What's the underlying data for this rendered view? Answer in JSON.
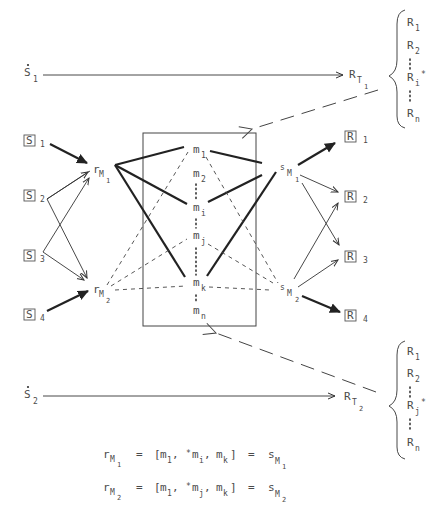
{
  "diagram": {
    "stimuli_boxed": [
      {
        "id": "S1",
        "glyph": "S",
        "index": "1"
      },
      {
        "id": "S2",
        "glyph": "S",
        "index": "2"
      },
      {
        "id": "S3",
        "glyph": "S",
        "index": "3"
      },
      {
        "id": "S4",
        "glyph": "S",
        "index": "4"
      }
    ],
    "responses_boxed": [
      {
        "id": "R1",
        "glyph": "R",
        "index": "1"
      },
      {
        "id": "R2",
        "glyph": "R",
        "index": "2"
      },
      {
        "id": "R3",
        "glyph": "R",
        "index": "3"
      },
      {
        "id": "R4",
        "glyph": "R",
        "index": "4"
      }
    ],
    "dotted_stimuli": [
      {
        "id": "S1dot",
        "glyph": "S",
        "index": "1"
      },
      {
        "id": "S2dot",
        "glyph": "S",
        "index": "2"
      }
    ],
    "mediators_in": [
      {
        "base": "r",
        "sub": "M",
        "subsub": "1"
      },
      {
        "base": "r",
        "sub": "M",
        "subsub": "2"
      }
    ],
    "mediators_out": [
      {
        "base": "s",
        "sub": "M",
        "subsub": "1"
      },
      {
        "base": "s",
        "sub": "M",
        "subsub": "2"
      }
    ],
    "meaning_components": [
      {
        "base": "m",
        "sub": "1"
      },
      {
        "base": "m",
        "sub": "2"
      },
      {
        "base": "m",
        "sub": "i"
      },
      {
        "base": "m",
        "sub": "j"
      },
      {
        "base": "m",
        "sub": "k"
      },
      {
        "base": "m",
        "sub": "n"
      }
    ],
    "total_responses": [
      {
        "base": "R",
        "sub": "T",
        "subsub": "1"
      },
      {
        "base": "R",
        "sub": "T",
        "subsub": "2"
      }
    ],
    "response_set_1": [
      {
        "base": "R",
        "sub": "1"
      },
      {
        "base": "R",
        "sub": "2"
      },
      {
        "base": "R",
        "sub": "i",
        "mark": "*"
      },
      {
        "base": "R",
        "sub": "n"
      }
    ],
    "response_set_2": [
      {
        "base": "R",
        "sub": "1"
      },
      {
        "base": "R",
        "sub": "2"
      },
      {
        "base": "R",
        "sub": "j",
        "mark": "*"
      },
      {
        "base": "R",
        "sub": "n"
      }
    ],
    "equations": [
      {
        "lhs": {
          "base": "r",
          "sub": "M",
          "subsub": "1"
        },
        "eq1": "=",
        "bracket_open": "[",
        "t1": "m",
        "t1_sub": "1",
        "comma1": ",",
        "star": "*",
        "t2": "m",
        "t2_sub": "i",
        "comma2": ",",
        "t3": "m",
        "t3_sub": "k",
        "bracket_close": "]",
        "eq2": "=",
        "rhs": {
          "base": "s",
          "sub": "M",
          "subsub": "1"
        }
      },
      {
        "lhs": {
          "base": "r",
          "sub": "M",
          "subsub": "2"
        },
        "eq1": "=",
        "bracket_open": "[",
        "t1": "m",
        "t1_sub": "1",
        "comma1": ",",
        "star": "*",
        "t2": "m",
        "t2_sub": "j",
        "comma2": ",",
        "t3": "m",
        "t3_sub": "k",
        "bracket_close": "]",
        "eq2": "=",
        "rhs": {
          "base": "s",
          "sub": "M",
          "subsub": "2"
        }
      }
    ],
    "colors": {
      "ink": "#333333",
      "text": "#4a4a4a",
      "background": "#ffffff"
    }
  }
}
